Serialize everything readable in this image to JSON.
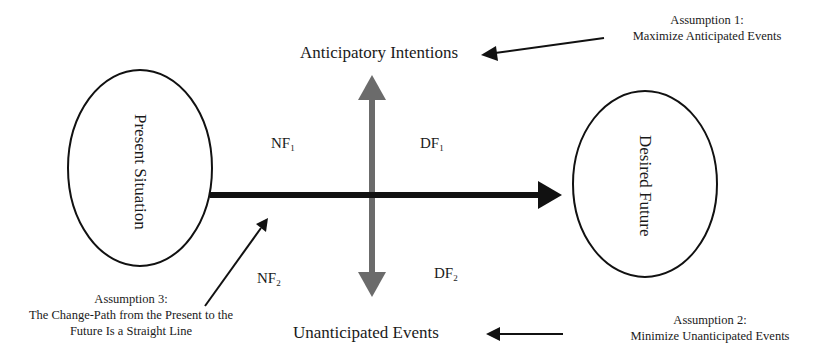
{
  "diagram": {
    "ellipses": {
      "left": {
        "label": "Present Situation"
      },
      "right": {
        "label": "Desired Future"
      }
    },
    "axes": {
      "top_label": "Anticipatory Intentions",
      "bottom_label": "Unanticipated Events"
    },
    "quadrants": {
      "nf1": {
        "base": "NF",
        "sub": "1"
      },
      "df1": {
        "base": "DF",
        "sub": "1"
      },
      "nf2": {
        "base": "NF",
        "sub": "2"
      },
      "df2": {
        "base": "DF",
        "sub": "2"
      }
    },
    "assumptions": {
      "a1": {
        "title": "Assumption 1:",
        "text": "Maximize Anticipated Events"
      },
      "a2": {
        "title": "Assumption 2:",
        "text": "Minimize Unanticipated Events"
      },
      "a3": {
        "title": "Assumption 3:",
        "line1": "The Change-Path from the Present to the",
        "line2": "Future Is a Straight Line"
      }
    },
    "colors": {
      "vertical_arrow": "#6b6b6b",
      "horizontal_arrow": "#111111",
      "ellipse_stroke": "#111111"
    }
  }
}
